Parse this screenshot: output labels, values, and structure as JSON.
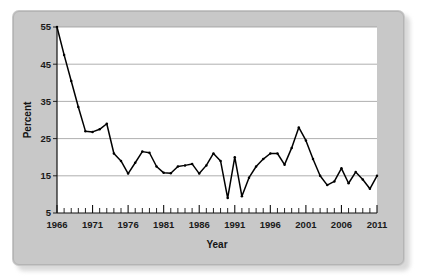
{
  "chart_data": {
    "type": "line",
    "title": "",
    "xlabel": "Year",
    "ylabel": "Percent",
    "xlim": [
      1966,
      2011
    ],
    "ylim": [
      5,
      55
    ],
    "grid": true,
    "legend": false,
    "y_ticks": [
      5,
      15,
      25,
      35,
      45,
      55
    ],
    "x_ticks": [
      1966,
      1971,
      1976,
      1981,
      1986,
      1991,
      1996,
      2001,
      2006,
      2011
    ],
    "x_minor_tick_step": 1,
    "series": [
      {
        "name": "Percent",
        "color": "#000000",
        "x": [
          1966,
          1967,
          1968,
          1969,
          1970,
          1971,
          1972,
          1973,
          1974,
          1975,
          1976,
          1977,
          1978,
          1979,
          1980,
          1981,
          1982,
          1983,
          1984,
          1985,
          1986,
          1987,
          1988,
          1989,
          1990,
          1991,
          1992,
          1993,
          1994,
          1995,
          1996,
          1997,
          1998,
          1999,
          2000,
          2001,
          2002,
          2003,
          2004,
          2005,
          2006,
          2007,
          2008,
          2009,
          2010,
          2011
        ],
        "values": [
          55.0,
          47.5,
          40.5,
          33.5,
          27.0,
          26.8,
          27.5,
          29.0,
          21.0,
          19.0,
          15.6,
          18.5,
          21.5,
          21.2,
          17.5,
          15.8,
          15.7,
          17.5,
          17.8,
          18.2,
          15.6,
          17.8,
          21.0,
          19.0,
          9.0,
          20.0,
          9.5,
          14.5,
          17.5,
          19.5,
          21.0,
          21.0,
          18.0,
          22.5,
          28.0,
          24.5,
          19.5,
          15.0,
          12.5,
          13.5,
          17.0,
          13.0,
          16.0,
          14.0,
          11.5,
          15.0
        ]
      }
    ]
  }
}
